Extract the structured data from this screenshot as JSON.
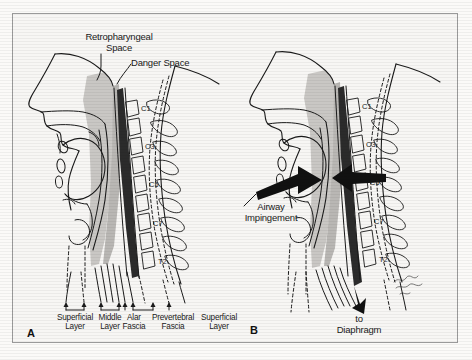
{
  "figure": {
    "type": "medical-illustration",
    "background_color": "#f7f6f4",
    "border_color": "#9a9a9a",
    "ink_color": "#1a1a1a",
    "shade_color": "#c9c7c4",
    "dark_band_color": "#2b2b2b"
  },
  "panels": [
    {
      "letter": "A",
      "name": "normal-anatomy",
      "callouts": [
        {
          "text": "Retropharyngeal\nSpace",
          "name": "retropharyngeal-space-label"
        },
        {
          "text": "Danger Space",
          "name": "danger-space-label"
        }
      ],
      "vertebrae": [
        "C1",
        "C3",
        "C5",
        "C7",
        "T2"
      ],
      "fascia_labels": [
        {
          "text": "Superficial\nLayer",
          "name": "superficial-layer-label-left"
        },
        {
          "text": "Middle\nLayer",
          "name": "middle-layer-label"
        },
        {
          "text": "Alar\nFascia",
          "name": "alar-fascia-label"
        },
        {
          "text": "Prevertebral\nFascia",
          "name": "prevertebral-fascia-label"
        },
        {
          "text": "Superficial\nLayer",
          "name": "superficial-layer-label-right"
        }
      ]
    },
    {
      "letter": "B",
      "name": "airway-impingement",
      "callouts": [
        {
          "text": "Airway\nImpingement",
          "name": "airway-impingement-label"
        },
        {
          "text": "to\nDiaphragm",
          "name": "to-diaphragm-label"
        }
      ],
      "vertebrae": [
        "C1",
        "C3",
        "C5",
        "C7",
        "T2"
      ],
      "signature": ""
    }
  ]
}
